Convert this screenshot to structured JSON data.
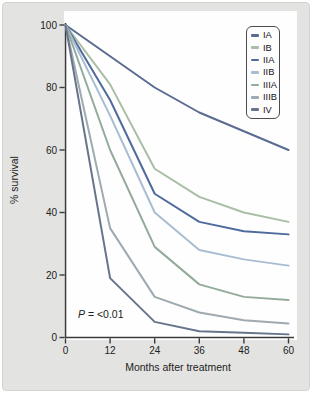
{
  "figure": {
    "background": "#e3e4e1",
    "plot_background": "#fefefe",
    "axis_color": "#3b3b3b",
    "text_color": "#222222"
  },
  "chart_data": {
    "type": "line",
    "title": "",
    "xlabel": "Months after treatment",
    "ylabel": "% survival",
    "x": [
      0,
      12,
      24,
      36,
      48,
      60
    ],
    "xticks": [
      0,
      12,
      24,
      36,
      48,
      60
    ],
    "yticks": [
      0,
      20,
      40,
      60,
      80,
      100
    ],
    "xlim": [
      0,
      60
    ],
    "ylim": [
      0,
      100
    ],
    "grid": false,
    "legend_position": "upper right",
    "series": [
      {
        "name": "IA",
        "color": "#5a6b92",
        "values": [
          100,
          90,
          80,
          72,
          66,
          60
        ]
      },
      {
        "name": "IB",
        "color": "#a9bfa5",
        "values": [
          100,
          81,
          54,
          45,
          40,
          37
        ]
      },
      {
        "name": "IIA",
        "color": "#4f6a9c",
        "values": [
          100,
          76,
          46,
          37,
          34,
          33
        ]
      },
      {
        "name": "IIB",
        "color": "#a9bdd2",
        "values": [
          100,
          71,
          40,
          28,
          25,
          23
        ]
      },
      {
        "name": "IIIA",
        "color": "#93ab9b",
        "values": [
          100,
          60,
          29,
          17,
          13,
          12
        ]
      },
      {
        "name": "IIIB",
        "color": "#9fa9b0",
        "values": [
          100,
          35,
          13,
          8,
          5.5,
          4.5
        ]
      },
      {
        "name": "IV",
        "color": "#68748c",
        "values": [
          100,
          19,
          5,
          2,
          1.5,
          1
        ]
      }
    ],
    "annotation_italic": "P",
    "annotation_rest": " = <0.01"
  }
}
